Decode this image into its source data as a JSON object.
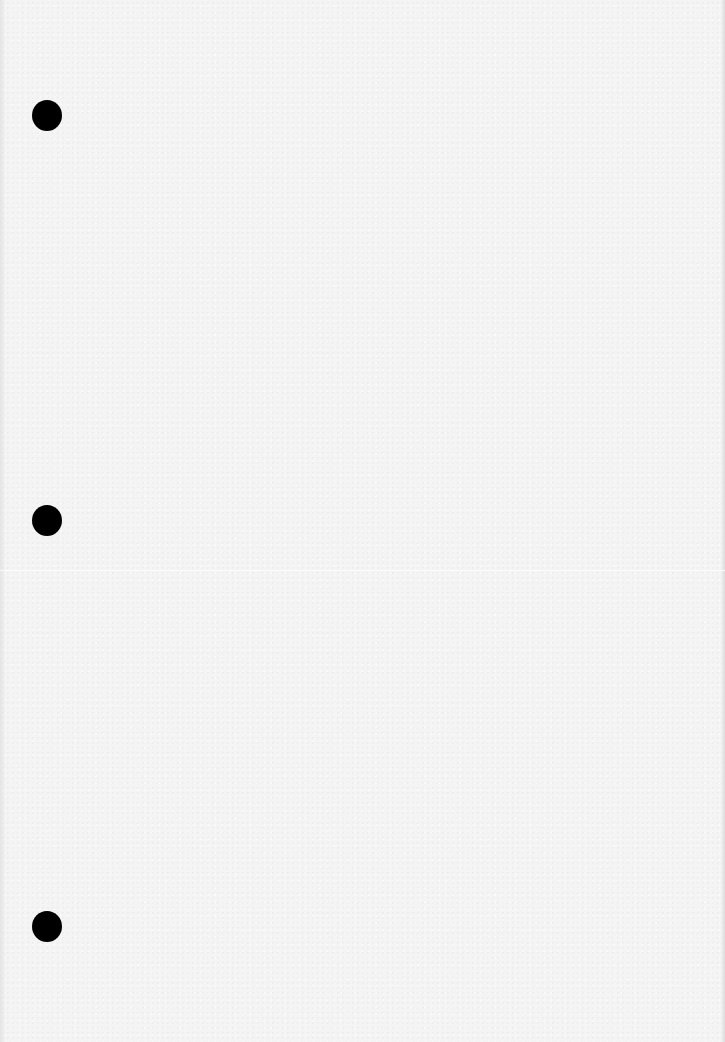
{
  "document": {
    "type": "blank-sheet",
    "background_color": "#f4f4f4",
    "text": "",
    "punch_holes": [
      {
        "id": "top",
        "cx": 47,
        "cy": 116
      },
      {
        "id": "middle",
        "cx": 47,
        "cy": 521
      },
      {
        "id": "bottom",
        "cx": 47,
        "cy": 927
      }
    ],
    "hole_color": "#000000"
  }
}
